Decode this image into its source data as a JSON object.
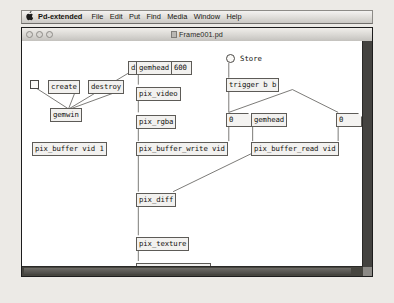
{
  "menubar": {
    "apple_icon": "apple-logo-icon",
    "items": [
      "Pd-extended",
      "File",
      "Edit",
      "Put",
      "Find",
      "Media",
      "Window",
      "Help"
    ]
  },
  "window": {
    "title": "Frame001.pd",
    "close_label": "",
    "minimize_label": "",
    "zoom_label": ""
  },
  "patch": {
    "objects": [
      {
        "id": "dimen",
        "text": "dimen 800 600",
        "kind": "message"
      },
      {
        "id": "toggle_gemwin",
        "text": "",
        "kind": "toggle"
      },
      {
        "id": "create",
        "text": "create",
        "kind": "message"
      },
      {
        "id": "destroy",
        "text": "destroy",
        "kind": "message"
      },
      {
        "id": "gemwin",
        "text": "gemwin",
        "kind": "object"
      },
      {
        "id": "gemhead_left",
        "text": "gemhead",
        "kind": "object"
      },
      {
        "id": "pix_video",
        "text": "pix_video",
        "kind": "object"
      },
      {
        "id": "pix_rgba",
        "text": "pix_rgba",
        "kind": "object"
      },
      {
        "id": "toggle_store",
        "text": "",
        "kind": "toggle"
      },
      {
        "id": "store_label",
        "text": "Store",
        "kind": "label"
      },
      {
        "id": "trigger",
        "text": "trigger b b",
        "kind": "object"
      },
      {
        "id": "num_write",
        "text": "0",
        "kind": "number"
      },
      {
        "id": "num_read",
        "text": "0",
        "kind": "number"
      },
      {
        "id": "gemhead_right",
        "text": "gemhead",
        "kind": "object"
      },
      {
        "id": "pix_buffer",
        "text": "pix_buffer vid 1",
        "kind": "object"
      },
      {
        "id": "pix_buffer_write",
        "text": "pix_buffer_write vid",
        "kind": "object"
      },
      {
        "id": "pix_buffer_read",
        "text": "pix_buffer_read vid",
        "kind": "object"
      },
      {
        "id": "pix_diff",
        "text": "pix_diff",
        "kind": "object"
      },
      {
        "id": "pix_texture",
        "text": "pix_texture",
        "kind": "object"
      },
      {
        "id": "rectangle",
        "text": "rectangle 5.33 4",
        "kind": "object"
      }
    ]
  }
}
